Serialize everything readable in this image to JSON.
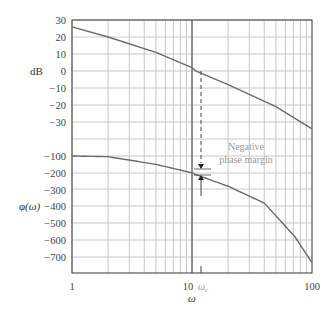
{
  "chart_data": {
    "type": "line",
    "title": "",
    "xlabel": "ω",
    "x_scale": "log",
    "xlim": [
      1,
      100
    ],
    "x_ticks": [
      "1",
      "10",
      "100"
    ],
    "x_annotation": "ω_c",
    "panels": [
      {
        "name": "magnitude",
        "ylabel": "dB",
        "y_ticks": [
          30,
          20,
          10,
          0,
          -10,
          -20,
          -30
        ],
        "series": [
          {
            "name": "Magnitude",
            "x": [
              1,
              2,
              5,
              10,
              10.7,
              20,
              50,
              100
            ],
            "values": [
              26,
              20,
              11,
              2,
              0,
              -8,
              -21,
              -34
            ]
          }
        ]
      },
      {
        "name": "phase",
        "ylabel": "φ(ω)",
        "y_ticks": [
          -100,
          -200,
          -300,
          -400,
          -500,
          -600,
          -700
        ],
        "series": [
          {
            "name": "Phase",
            "x": [
              1,
              2,
              5,
              10,
              10.7,
              20,
              40,
              72,
              100
            ],
            "values": [
              -100,
              -104,
              -150,
              -200,
              -210,
              -280,
              -380,
              -580,
              -735
            ]
          }
        ]
      }
    ],
    "annotations": [
      {
        "text_line1": "Negative",
        "text_line2": "phase margin",
        "at_omega": 10.7,
        "from_deg": -180,
        "to_deg": -210
      }
    ],
    "grid": true,
    "legend": "none"
  },
  "labels": {
    "db": "dB",
    "phi": "φ(ω)",
    "omega": "ω",
    "omega_c": "ω",
    "omega_c_sub": "c",
    "note1": "Negative",
    "note2": "phase margin",
    "x1": "1",
    "x10": "10",
    "x100": "100"
  },
  "colors": {
    "curve": "#6b6b6b",
    "grid": "#c8c8c8",
    "axis": "#555555",
    "note": "#9a9a9a"
  }
}
